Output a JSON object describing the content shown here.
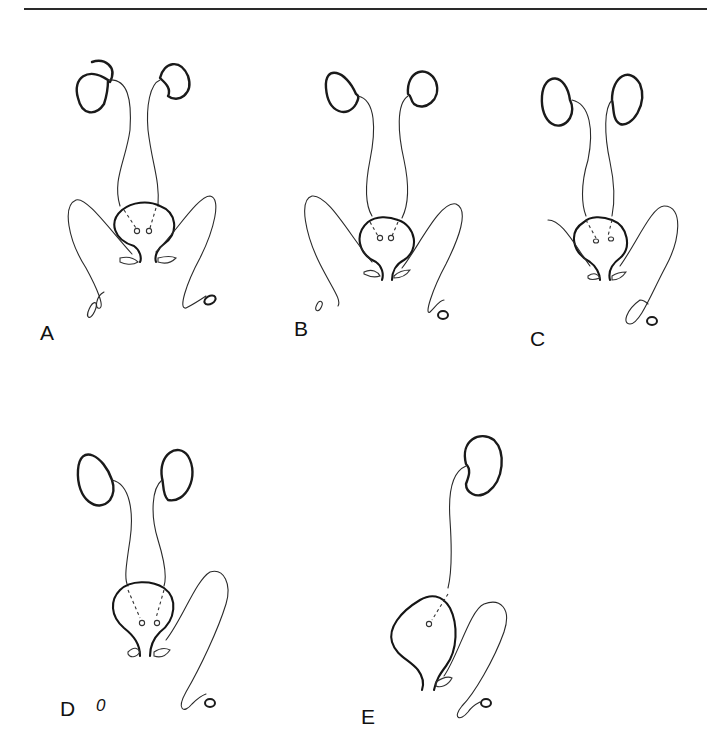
{
  "figure": {
    "panels": [
      {
        "id": "A",
        "label": "A"
      },
      {
        "id": "B",
        "label": "B"
      },
      {
        "id": "C",
        "label": "C"
      },
      {
        "id": "D",
        "label": "D"
      },
      {
        "id": "E",
        "label": "E"
      }
    ],
    "stray_marks": {
      "D": "0"
    }
  }
}
